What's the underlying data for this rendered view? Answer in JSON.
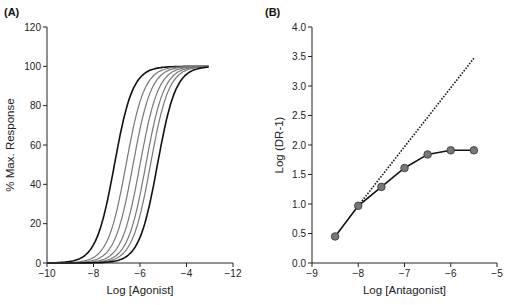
{
  "chart_data": [
    {
      "panel": "(A)",
      "type": "line",
      "title": "",
      "xlabel": "Log [Agonist]",
      "ylabel": "% Max. Response",
      "x_ticks": [
        "-10",
        "-8",
        "-6",
        "-4",
        "-12"
      ],
      "y_ticks": [
        "0",
        "20",
        "40",
        "60",
        "80",
        "100",
        "120"
      ],
      "xlim": [
        -10,
        -2
      ],
      "ylim": [
        0,
        120
      ],
      "grid": false,
      "curve_color_outer": "#111111",
      "curve_color_inner": "#777777",
      "series": [
        {
          "name": "control",
          "ec50_log": -7.1,
          "max": 100,
          "color": "#111111"
        },
        {
          "name": "antagonist 1",
          "ec50_log": -6.6,
          "max": 100,
          "color": "#777777"
        },
        {
          "name": "antagonist 2",
          "ec50_log": -6.3,
          "max": 100,
          "color": "#777777"
        },
        {
          "name": "antagonist 3",
          "ec50_log": -6.0,
          "max": 100,
          "color": "#777777"
        },
        {
          "name": "antagonist 4",
          "ec50_log": -5.75,
          "max": 100,
          "color": "#777777"
        },
        {
          "name": "antagonist 5",
          "ec50_log": -5.55,
          "max": 100,
          "color": "#777777"
        },
        {
          "name": "antagonist 6",
          "ec50_log": -5.25,
          "max": 100,
          "color": "#111111"
        }
      ]
    },
    {
      "panel": "(B)",
      "type": "line",
      "title": "",
      "xlabel": "Log [Antagonist]",
      "ylabel": "Log (DR-1)",
      "x_ticks": [
        "-9",
        "-8",
        "-7",
        "-6",
        "-5"
      ],
      "y_ticks": [
        "0.0",
        "0.5",
        "1.0",
        "1.5",
        "2.0",
        "2.5",
        "3.0",
        "3.5",
        "4.0"
      ],
      "xlim": [
        -9,
        -5
      ],
      "ylim": [
        0,
        4
      ],
      "grid": false,
      "series": [
        {
          "name": "observed",
          "x": [
            -8.5,
            -8.0,
            -7.5,
            -7.0,
            -6.5,
            -6.0,
            -5.5
          ],
          "y": [
            0.45,
            0.97,
            1.29,
            1.61,
            1.84,
            1.91,
            1.91
          ],
          "marker": "circle",
          "marker_color": "#777777",
          "line_color": "#111111"
        },
        {
          "name": "Schild unity line",
          "x": [
            -8.0,
            -5.5
          ],
          "y": [
            0.97,
            3.47
          ],
          "style": "dotted",
          "line_color": "#111111"
        }
      ]
    }
  ]
}
